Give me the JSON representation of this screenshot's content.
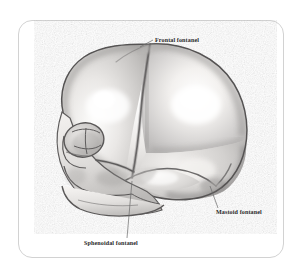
{
  "figure": {
    "medium": "pencil-shaded anatomical illustration",
    "background_color": "#ffffff",
    "frame": {
      "border_color": "#d2d2d2",
      "corner_radius": "14px",
      "shape": "rounded-rectangle"
    }
  },
  "labels": [
    {
      "id": "frontal",
      "text": "Frontal fontanel",
      "leader_from": "label-left",
      "leader_to": "superior-anterior cranial vertex"
    },
    {
      "id": "mastoid",
      "text": "Mastoid fontanel",
      "leader_from": "label-top-left",
      "leader_to": "posterior-inferior temporal region"
    },
    {
      "id": "sphenoidal",
      "text": "Sphenoidal fontanel",
      "leader_from": "label-top",
      "leader_to": "anterior-inferior temporal region"
    }
  ],
  "anatomy": {
    "structures": [
      "frontal bone",
      "parietal bone",
      "occipital bone",
      "temporal squama",
      "orbit",
      "nasal bone",
      "zygomatic arch",
      "maxilla",
      "mandible"
    ],
    "sutures": [
      "coronal suture",
      "squamous suture",
      "lambdoid suture",
      "metopic suture"
    ]
  },
  "palette": {
    "ink": "#5a585a",
    "ink_dark": "#3e3c3e",
    "shade_mid": "#b3b2b1",
    "shade_light": "#d8d7d5",
    "highlight": "#fbfbfa",
    "label_color": "#2a2a2a",
    "leader_color": "#6a6a6a"
  }
}
